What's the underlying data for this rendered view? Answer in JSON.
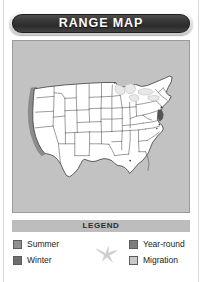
{
  "banner": {
    "title": "RANGE MAP"
  },
  "map": {
    "name": "united-states-range-map",
    "background_color": "#c2c2c2",
    "land_color": "#ffffff",
    "outline_color": "#3a3a3a",
    "shaded_regions": [
      {
        "name": "pacific-coast-strip",
        "color": "#8d8d8d"
      },
      {
        "name": "mid-atlantic-coast-strip",
        "color": "#555555"
      }
    ]
  },
  "legend": {
    "header": "LEGEND",
    "bird_icon": "flying-bird-icon",
    "bird_color": "#cfcfcf",
    "columns": [
      {
        "items": [
          {
            "label": "Summer",
            "color": "#8f8f8f"
          },
          {
            "label": "Winter",
            "color": "#6e6e6e"
          }
        ]
      },
      {
        "items": [
          {
            "label": "Year-round",
            "color": "#7d7d7d"
          },
          {
            "label": "Migration",
            "color": "#c8c8c8"
          }
        ]
      }
    ]
  }
}
